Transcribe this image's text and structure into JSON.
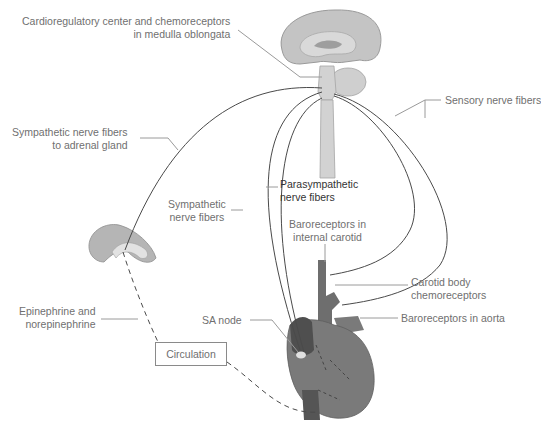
{
  "figure": {
    "topic": "Regulation of heart rate and blood pressure",
    "labels": {
      "cardioregulatory": [
        "Cardioregulatory center and chemoreceptors",
        "in medulla oblongata"
      ],
      "sympathetic_adrenal": [
        "Sympathetic nerve fibers",
        "to adrenal gland"
      ],
      "sensory": "Sensory nerve fibers",
      "sympathetic": [
        "Sympathetic",
        "nerve fibers"
      ],
      "parasympathetic": [
        "Parasympathetic",
        "nerve fibers"
      ],
      "baro_internal_carotid": [
        "Baroreceptors in",
        "internal carotid"
      ],
      "carotid_body": [
        "Carotid body",
        "chemoreceptors"
      ],
      "baro_aorta": "Baroreceptors in aorta",
      "epinephrine": [
        "Epinephrine and",
        "norepinephrine"
      ],
      "sa_node": "SA node",
      "circulation": "Circulation"
    },
    "colors": {
      "label_text": "#6f6f6f",
      "label_text_dark": "#333333",
      "leader_line": "#9a9a9a",
      "nerve_line": "#4a4a4a",
      "brain_fill": "#bdbdbd",
      "heart_fill": "#6e6e6e",
      "heart_dark": "#4a4a4a"
    }
  }
}
